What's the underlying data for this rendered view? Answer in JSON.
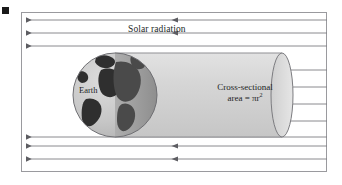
{
  "figure": {
    "type": "solar-radiation-cross-section-diagram",
    "labels": {
      "solar_radiation": "Solar radiation",
      "earth": "Earth",
      "cross_section_line1": "Cross-sectional",
      "cross_section_line2_prefix": "area = ",
      "cross_section_line2_symbol": "πr",
      "cross_section_line2_exponent": "2"
    },
    "colors": {
      "ray_line": "#7d7d82",
      "frame_border": "#9a9a9e",
      "cylinder_fill": "#d5d5d5",
      "cylinder_edge": "#8f8f93",
      "globe_lit": "#c9c9c9",
      "globe_shade": "#a0a0a0",
      "globe_land": "#2f2f2f",
      "corner_mark": "#1a1a1a",
      "text": "#231f1f"
    },
    "geometry": {
      "frame": {
        "x": 21,
        "y": 12,
        "width": 306,
        "height": 160
      },
      "cylinder": {
        "left": 115,
        "right": 282,
        "top": 53,
        "bottom": 137
      },
      "end_cap_ellipse": {
        "cx": 282,
        "cy": 95,
        "rx": 11,
        "ry": 42
      },
      "globe": {
        "cx": 115,
        "cy": 95,
        "r": 42
      },
      "ray_count_left": 6,
      "ray_count_right": 4,
      "ray_y_positions": [
        20,
        33,
        46,
        57,
        70,
        82,
        95,
        108,
        121,
        133,
        146,
        159
      ],
      "left_arrow_x": 26,
      "mid_arrow_x": 172
    }
  }
}
